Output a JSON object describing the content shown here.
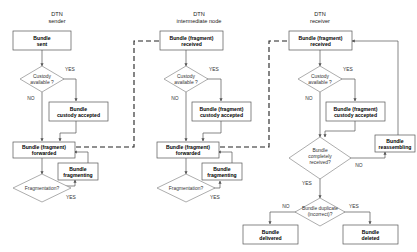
{
  "diagram": {
    "colors": {
      "background": "#ffffff",
      "box_stroke": "#555555",
      "diamond_stroke": "#8a8a8a",
      "edge": "#555555",
      "dashed_edge": "#222222",
      "text": "#111111"
    },
    "labels": {
      "yes": "YES",
      "no": "NO"
    },
    "lanes": [
      {
        "id": "sender",
        "title_line1": "DTN",
        "title_line2": "sender"
      },
      {
        "id": "intermediate",
        "title_line1": "DTN",
        "title_line2": "intermediate node"
      },
      {
        "id": "receiver",
        "title_line1": "DTN",
        "title_line2": "receiver"
      }
    ],
    "nodes": {
      "sender_start": {
        "line1": "Bundle",
        "line2": "sent"
      },
      "sender_custody_q": {
        "line1": "Custody",
        "line2": "available ?"
      },
      "sender_custody_accepted": {
        "line1": "Bundle",
        "line2": "custody accepted"
      },
      "sender_forwarded": {
        "line1": "Bundle (fragment)",
        "line2": "forwarded"
      },
      "sender_fragmenting": {
        "line1": "Bundle",
        "line2": "fragmenting"
      },
      "sender_fragmentation_q": {
        "line1": "Fragmentation?",
        "line2": ""
      },
      "inter_received": {
        "line1": "Bundle (fragment)",
        "line2": "received"
      },
      "inter_custody_q": {
        "line1": "Custody",
        "line2": "available ?"
      },
      "inter_custody_accepted": {
        "line1": "Bundle (fragment)",
        "line2": "custody accepted"
      },
      "inter_forwarded": {
        "line1": "Bundle (fragment)",
        "line2": "forwarded"
      },
      "inter_fragmenting": {
        "line1": "Bundle",
        "line2": "fragmenting"
      },
      "inter_fragmentation_q": {
        "line1": "Fragmentation?",
        "line2": ""
      },
      "recv_received": {
        "line1": "Bundle (fragment)",
        "line2": "received"
      },
      "recv_custody_q": {
        "line1": "Custody",
        "line2": "available ?"
      },
      "recv_custody_accepted": {
        "line1": "Bundle (fragment)",
        "line2": "custody accepted"
      },
      "recv_complete_q": {
        "line1": "Bundle",
        "line2": "completely",
        "line3": "received?"
      },
      "recv_reassembling": {
        "line1": "Bundle",
        "line2": "reassembling"
      },
      "recv_duplicate_q": {
        "line1": "Bundle duplicate",
        "line2": "(incorrect)?"
      },
      "recv_delivered": {
        "line1": "Bundle",
        "line2": "delivered"
      },
      "recv_deleted": {
        "line1": "Bundle",
        "line2": "deleted"
      }
    },
    "edge_labels": {
      "sender_custody_yes": "YES",
      "sender_custody_no": "NO",
      "sender_frag_yes": "YES",
      "inter_custody_yes": "YES",
      "inter_custody_no": "NO",
      "inter_frag_yes": "YES",
      "recv_custody_yes": "YES",
      "recv_custody_no": "NO",
      "recv_complete_yes": "YES",
      "recv_complete_no": "NO",
      "recv_dup_yes": "YES",
      "recv_dup_no": "NO"
    }
  }
}
